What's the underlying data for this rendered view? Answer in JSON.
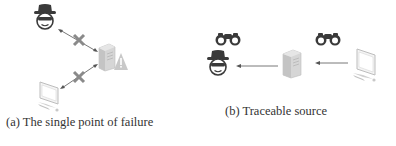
{
  "figure": {
    "panels": [
      {
        "id": "a",
        "caption": "(a) The single point of failure",
        "nodes": [
          "hacker",
          "server-with-warning",
          "computer"
        ],
        "links": [
          {
            "from": "hacker",
            "to": "server",
            "style": "bidirectional-arrow",
            "blocked": true
          },
          {
            "from": "server",
            "to": "computer",
            "style": "bidirectional-arrow",
            "blocked": true
          }
        ]
      },
      {
        "id": "b",
        "caption": "(b) Traceable source",
        "nodes": [
          "hacker",
          "server",
          "computer"
        ],
        "links": [
          {
            "from": "server",
            "to": "hacker",
            "style": "arrow",
            "observed": true
          },
          {
            "from": "computer",
            "to": "server",
            "style": "arrow",
            "observed": true
          }
        ]
      }
    ],
    "colors": {
      "icon_dark": "#3a3a3a",
      "icon_gray": "#b8b8b8",
      "x_mark": "#8a8a8a",
      "arrow": "#555555",
      "caption_text": "#333333"
    }
  }
}
